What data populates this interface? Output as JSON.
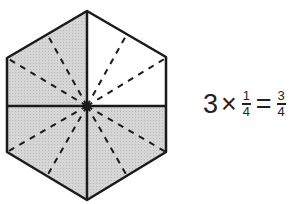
{
  "diagram": {
    "shape": "hexagon",
    "shaded_fraction": "3/4",
    "fill_color": "#cfcfcf",
    "stroke_color": "#1a1a1a"
  },
  "equation": {
    "multiplier": "3",
    "times": "×",
    "fraction1": {
      "numerator": "1",
      "denominator": "4"
    },
    "equals": "=",
    "result": {
      "numerator": "3",
      "denominator": "4"
    }
  }
}
